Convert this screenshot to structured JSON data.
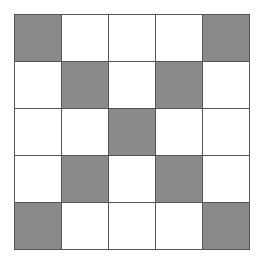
{
  "grid": {
    "rows": 5,
    "cols": 5,
    "fill_color": "#8a8a8a",
    "empty_color": "#ffffff",
    "line_color": "#555555",
    "cells": [
      [
        1,
        0,
        0,
        0,
        1
      ],
      [
        0,
        1,
        0,
        1,
        0
      ],
      [
        0,
        0,
        1,
        0,
        0
      ],
      [
        0,
        1,
        0,
        1,
        0
      ],
      [
        1,
        0,
        0,
        0,
        1
      ]
    ]
  }
}
